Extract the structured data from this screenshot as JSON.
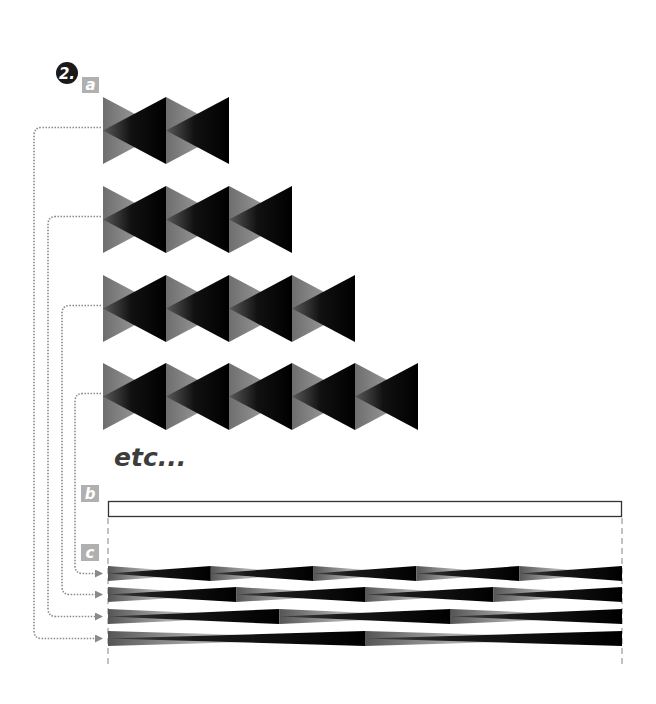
{
  "figure": {
    "step_number": "2.",
    "labels": {
      "a": "a",
      "b": "b",
      "c": "c"
    },
    "continuation_text": "etc...",
    "colors": {
      "step_badge": "#1a1a1a",
      "label_badge": "#b0b0b0",
      "connector": "#8a8a8a",
      "guide": "#9a9a9a",
      "shape_dark": "#000000",
      "shape_light": "#9a9a9a",
      "strip_outline": "#333333"
    },
    "sequences": [
      {
        "name": "sequence-2-units",
        "repetitions": 2,
        "maps_to_strip": 3
      },
      {
        "name": "sequence-3-units",
        "repetitions": 3,
        "maps_to_strip": 2
      },
      {
        "name": "sequence-4-units",
        "repetitions": 4,
        "maps_to_strip": 1
      },
      {
        "name": "sequence-5-units",
        "repetitions": 5,
        "maps_to_strip": 0
      }
    ],
    "strips": [
      {
        "name": "strip-5-units",
        "repetitions": 5
      },
      {
        "name": "strip-4-units",
        "repetitions": 4
      },
      {
        "name": "strip-3-units",
        "repetitions": 3
      },
      {
        "name": "strip-2-units",
        "repetitions": 2
      }
    ]
  }
}
